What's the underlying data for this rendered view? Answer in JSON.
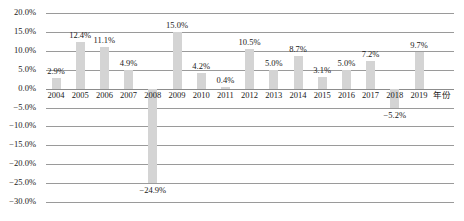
{
  "chart_data": {
    "type": "bar",
    "title": "",
    "xlabel": "年份",
    "ylabel": "",
    "categories": [
      "2004",
      "2005",
      "2006",
      "2007",
      "2008",
      "2009",
      "2010",
      "2011",
      "2012",
      "2013",
      "2014",
      "2015",
      "2016",
      "2017",
      "2018",
      "2019"
    ],
    "values": [
      2.9,
      12.4,
      11.1,
      4.9,
      -24.9,
      15.0,
      4.2,
      0.4,
      10.5,
      5.0,
      8.7,
      3.1,
      5.0,
      7.2,
      -5.2,
      9.7
    ],
    "data_labels": [
      "2.9%",
      "12.4%",
      "11.1%",
      "4.9%",
      "−24.9%",
      "15.0%",
      "4.2%",
      "0.4%",
      "10.5%",
      "5.0%",
      "8.7%",
      "3.1%",
      "5.0%",
      "7.2%",
      "−5.2%",
      "9.7%"
    ],
    "ylim": [
      -30.0,
      20.0
    ],
    "ytick_values": [
      20.0,
      15.0,
      10.0,
      5.0,
      0.0,
      -5.0,
      -10.0,
      -15.0,
      -20.0,
      -25.0,
      -30.0
    ],
    "ytick_labels": [
      "20.0%",
      "15.0%",
      "10.0%",
      "5.0%",
      "0.0%",
      "−5.0%",
      "−10.0%",
      "−15.0%",
      "−20.0%",
      "−25.0%",
      "−30.0%"
    ],
    "grid": true,
    "legend": "none",
    "bar_color": "#d4d4d4",
    "gridline_color": "#9a9a9a",
    "text_color": "#1a1a1a"
  }
}
